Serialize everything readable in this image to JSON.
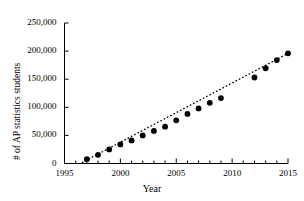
{
  "chart_data": {
    "type": "scatter",
    "title": "",
    "xlabel": "Year",
    "ylabel": "# of AP statistics students",
    "xlim": [
      1995,
      2015
    ],
    "ylim": [
      0,
      250000
    ],
    "xticks": [
      1995,
      2000,
      2005,
      2010,
      2015
    ],
    "xtick_labels": [
      "1995",
      "2000",
      "2005",
      "2010",
      "2015"
    ],
    "x_minor_tick_step": 1,
    "yticks": [
      0,
      50000,
      100000,
      150000,
      200000,
      250000
    ],
    "ytick_labels": [
      "0",
      "50,000",
      "100,000",
      "150,000",
      "200,000",
      "250,000"
    ],
    "grid": false,
    "legend": "none",
    "marker": {
      "shape": "circle",
      "color": "#000000",
      "size": 5
    },
    "trendline": {
      "style": "dotted",
      "color": "#000000",
      "x": [
        1996.6,
        2015.2
      ],
      "y": [
        2000,
        198000
      ]
    },
    "x": [
      1997,
      1998,
      1999,
      2000,
      2001,
      2002,
      2003,
      2004,
      2005,
      2006,
      2007,
      2008,
      2009,
      2012,
      2013,
      2014,
      2015
    ],
    "y": [
      7700,
      15500,
      25000,
      34000,
      41000,
      50000,
      58000,
      65500,
      76800,
      88200,
      98000,
      108000,
      116500,
      153000,
      169500,
      184000,
      196000
    ],
    "points": [
      {
        "year": 1997,
        "students": 7700
      },
      {
        "year": 1998,
        "students": 15500
      },
      {
        "year": 1999,
        "students": 25000
      },
      {
        "year": 2000,
        "students": 34000
      },
      {
        "year": 2001,
        "students": 41000
      },
      {
        "year": 2002,
        "students": 50000
      },
      {
        "year": 2003,
        "students": 58000
      },
      {
        "year": 2004,
        "students": 65500
      },
      {
        "year": 2005,
        "students": 76800
      },
      {
        "year": 2006,
        "students": 88200
      },
      {
        "year": 2007,
        "students": 98000
      },
      {
        "year": 2008,
        "students": 108000
      },
      {
        "year": 2009,
        "students": 116500
      },
      {
        "year": 2012,
        "students": 153000
      },
      {
        "year": 2013,
        "students": 169500
      },
      {
        "year": 2014,
        "students": 184000
      },
      {
        "year": 2015,
        "students": 196000
      }
    ]
  },
  "axis": {
    "x_title": "Year",
    "y_title": "# of AP statistics students"
  },
  "colors": {
    "marker": "#000000",
    "axis": "#000000",
    "background": "#ffffff"
  }
}
